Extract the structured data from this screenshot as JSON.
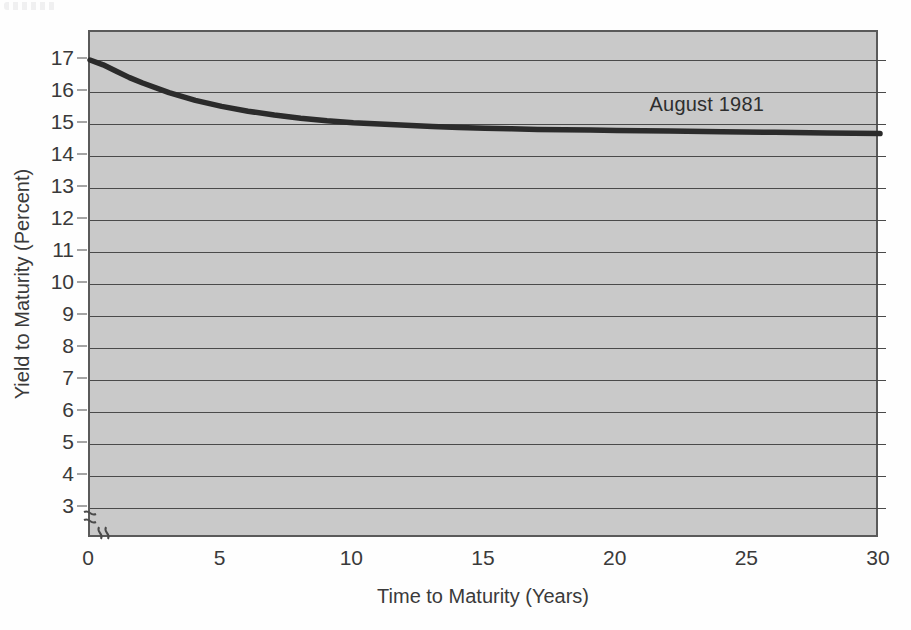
{
  "chart_data": {
    "type": "line",
    "title": "",
    "subtitle": "",
    "xlabel": "Time to Maturity (Years)",
    "ylabel": "Yield to Maturity (Percent)",
    "xlim": [
      0,
      30
    ],
    "ylim": [
      3,
      17.5
    ],
    "x_ticks": [
      0,
      5,
      10,
      15,
      20,
      25,
      30
    ],
    "x_tick_labels": [
      "0",
      "5",
      "10",
      "15",
      "20",
      "25",
      "30"
    ],
    "y_ticks": [
      3,
      4,
      5,
      6,
      7,
      8,
      9,
      10,
      11,
      12,
      13,
      14,
      15,
      16,
      17
    ],
    "y_tick_labels": [
      "3",
      "4",
      "5",
      "6",
      "7",
      "8",
      "9",
      "10",
      "11",
      "12",
      "13",
      "14",
      "15",
      "16",
      "17"
    ],
    "grid": "horizontal",
    "axis_breaks": [
      "y-axis below 3",
      "x-axis after 0"
    ],
    "legend_position": "inline-annotation",
    "plot_background": "#c9c9c9",
    "line_color": "#2b2b2b",
    "line_width_px": 5,
    "series": [
      {
        "name": "August 1981",
        "annotation": "August 1981",
        "annotation_x": 23.5,
        "annotation_y": 15.55,
        "x": [
          0,
          0.5,
          1,
          1.5,
          2,
          3,
          4,
          5,
          6,
          7,
          8,
          9,
          10,
          11,
          12,
          13,
          14,
          15,
          16,
          17,
          18,
          19,
          20,
          22,
          24,
          26,
          28,
          30
        ],
        "values": [
          17.0,
          16.85,
          16.65,
          16.45,
          16.28,
          15.98,
          15.74,
          15.55,
          15.4,
          15.28,
          15.18,
          15.1,
          15.04,
          15.0,
          14.96,
          14.92,
          14.89,
          14.87,
          14.85,
          14.83,
          14.82,
          14.81,
          14.8,
          14.78,
          14.76,
          14.74,
          14.72,
          14.7
        ]
      }
    ]
  },
  "figure": {
    "y_axis_title": "Yield to Maturity (Percent)",
    "x_axis_title": "Time to Maturity (Years)",
    "series_label": "August 1981",
    "y_tick_labels": [
      "17",
      "16",
      "15",
      "14",
      "13",
      "12",
      "11",
      "10",
      "9",
      "8",
      "7",
      "6",
      "5",
      "4",
      "3"
    ],
    "x_tick_labels": [
      "0",
      "5",
      "10",
      "15",
      "20",
      "25",
      "30"
    ]
  }
}
